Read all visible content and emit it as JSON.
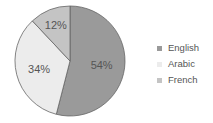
{
  "chart_data": {
    "type": "pie",
    "title": "",
    "categories": [
      "English",
      "Arabic",
      "French"
    ],
    "values": [
      54,
      34,
      12
    ],
    "labels": [
      "54%",
      "34%",
      "12%"
    ],
    "colors": [
      "#9a9a9a",
      "#ececec",
      "#c4c4c4"
    ],
    "start_angle_deg": 0,
    "direction": "clockwise",
    "legend_position": "right",
    "slice_border_color": "#666666"
  },
  "legend": {
    "items": [
      {
        "label": "English",
        "color": "#9a9a9a"
      },
      {
        "label": "Arabic",
        "color": "#ececec"
      },
      {
        "label": "French",
        "color": "#c4c4c4"
      }
    ]
  }
}
